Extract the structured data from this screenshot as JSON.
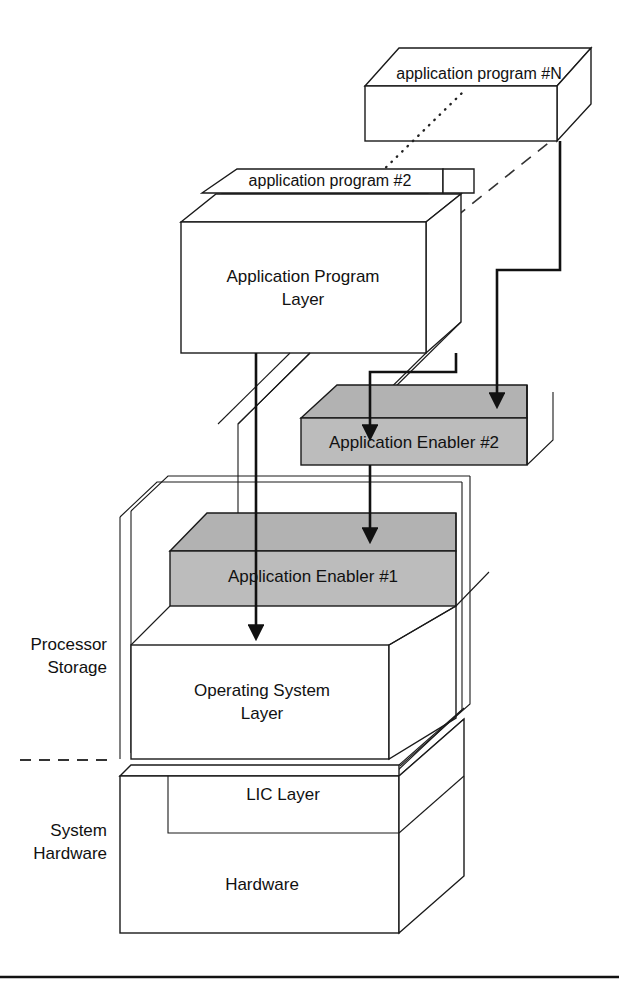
{
  "figure": {
    "type": "layered-3d-block-diagram"
  },
  "colors": {
    "line": "#1a1a1a",
    "enabler_fill": "#bcbcbc",
    "box_fill": "#ffffff",
    "background": "#ffffff"
  },
  "boxes": {
    "app_program_n": "application program #N",
    "app_program_2": "application program #2",
    "app_program_1": "application program #1",
    "app_program_layer_line1": "Application Program",
    "app_program_layer_line2": "Layer",
    "enabler_2": "Application Enabler #2",
    "enabler_1": "Application Enabler #1",
    "os_layer_line1": "Operating System",
    "os_layer_line2": "Layer",
    "lic_layer": "LIC Layer",
    "hardware": "Hardware"
  },
  "side_labels": {
    "processor_storage_line1": "Processor",
    "processor_storage_line2": "Storage",
    "system_hardware_line1": "System",
    "system_hardware_line2": "Hardware"
  },
  "connectors": [
    {
      "name": "app-layer-to-enabler1",
      "from": "Application Program Layer",
      "to": "Operating System Layer",
      "style": "solid-arrow",
      "passes_through": "Application Enabler #1"
    },
    {
      "name": "app-layer-to-enabler2",
      "from": "Application Program Layer",
      "to": "Application Enabler #2",
      "style": "solid-arrow"
    },
    {
      "name": "enabler2-to-enabler1",
      "from": "Application Enabler #2",
      "to": "Application Enabler #1",
      "style": "solid-arrow"
    },
    {
      "name": "app-program-n-to-enabler2",
      "from": "application program #N",
      "to": "Application Enabler #2",
      "style": "solid-arrow"
    }
  ],
  "leader_lines": [
    {
      "name": "dotted-leader-program-n",
      "style": "dotted",
      "meaning": "continuation between application program #2 and #N"
    },
    {
      "name": "dashed-leader-program-n",
      "style": "dashed",
      "meaning": "continuation of program stack depth"
    },
    {
      "name": "dashed-separator-storage-hardware",
      "style": "dashed",
      "meaning": "boundary between Processor Storage and System Hardware"
    }
  ]
}
